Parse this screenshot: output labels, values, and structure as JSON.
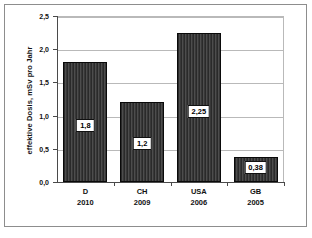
{
  "chart_data": {
    "type": "bar",
    "title": "",
    "xlabel": "",
    "ylabel": "effektive Dosis, mSv pro Jahr",
    "ylim": [
      0,
      2.5
    ],
    "ytick_labels": [
      "0,0",
      "0,5",
      "1,0",
      "1,5",
      "2,0",
      "2,5"
    ],
    "ytick_values": [
      0,
      0.5,
      1.0,
      1.5,
      2.0,
      2.5
    ],
    "grid": true,
    "legend": "none",
    "categories": [
      "D",
      "CH",
      "USA",
      "GB"
    ],
    "category_years": [
      "2010",
      "2009",
      "2006",
      "2005"
    ],
    "values": [
      1.8,
      1.2,
      2.25,
      0.38
    ],
    "value_labels": [
      "1,8",
      "1,2",
      "2,25",
      "0,38"
    ],
    "bar_color": "#3a3a3a",
    "bar_edge_color": "#0a0a0a",
    "grid_color": "#b9b9b9",
    "axis_color": "#4a4a4a",
    "label_box_background": "#ffffff",
    "label_box_border": "#111111"
  },
  "figure": {
    "frame_color": "#8d8d8d",
    "background": "#ffffff"
  }
}
